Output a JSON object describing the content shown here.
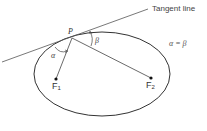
{
  "diagram": {
    "tangent_label": "Tangent line",
    "equation": "α = β",
    "point_label": "P",
    "angle_alpha": "α",
    "angle_beta": "β",
    "focus1": {
      "name": "F",
      "sub": "1"
    },
    "focus2": {
      "name": "F",
      "sub": "2"
    },
    "colors": {
      "stroke": "#333333",
      "background": "#ffffff"
    }
  }
}
